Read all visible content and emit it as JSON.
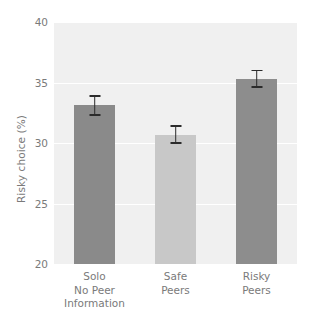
{
  "chart_data": {
    "type": "bar",
    "title": "",
    "subtitle": "",
    "xlabel": "",
    "ylabel": "Risky choice (%)",
    "categories": [
      "Solo\nNo Peer\nInformation",
      "Safe\nPeers",
      "Risky\nPeers"
    ],
    "category_lines": [
      [
        "Solo",
        "No Peer",
        "Information"
      ],
      [
        "Safe",
        "Peers"
      ],
      [
        "Risky",
        "Peers"
      ]
    ],
    "values": [
      33.1,
      30.7,
      35.3
    ],
    "errors": [
      0.85,
      0.75,
      0.75
    ],
    "error_type": "sem",
    "bar_colors": [
      "#8a8a8a",
      "#c8c8c8",
      "#8d8d8d"
    ],
    "ylim": [
      20,
      40
    ],
    "yticks": [
      20,
      25,
      30,
      35,
      40
    ],
    "ytick_labels": [
      "20",
      "25",
      "30",
      "35",
      "40"
    ],
    "xlim": [
      0,
      3
    ],
    "grid": true,
    "grid_axis": "y",
    "grid_color": "#ffffff",
    "legend": null,
    "plot_background": "#f0f0f0",
    "figure_background": "#ffffff",
    "tick_label_color": "#7a7a7a",
    "errorbar_color": "#2b2b2b",
    "bar_width_fraction": 0.5,
    "annotations": []
  }
}
